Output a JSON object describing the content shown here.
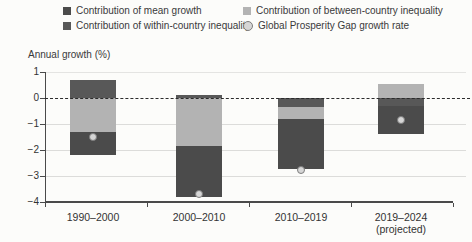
{
  "axis_title": "Annual growth (%)",
  "legend": {
    "items": [
      {
        "label": "Contribution of mean growth",
        "swatch": "square",
        "color": "#4b4b4b"
      },
      {
        "label": "Contribution of between-country inequality",
        "swatch": "square",
        "color": "#b3b3b3"
      },
      {
        "label": "Contribution of within-country inequality",
        "swatch": "square",
        "color": "#585858"
      },
      {
        "label": "Global Prosperity Gap growth rate",
        "swatch": "circle",
        "color": "#d6d6d6",
        "border_color": "#7d7d7d"
      }
    ]
  },
  "chart_data": {
    "type": "bar",
    "subtype": "stacked-bar-with-point-markers",
    "title": "",
    "xlabel": "",
    "ylabel": "Annual growth (%)",
    "ylim": [
      -4,
      1
    ],
    "yticks": [
      1,
      0,
      -1,
      -2,
      -3,
      -4
    ],
    "grid": "horizontal, light gray at integer values; dashed black line at 0",
    "legend_position": "top",
    "categories": [
      {
        "label": "1990–2000",
        "sublabel": ""
      },
      {
        "label": "2000–2010",
        "sublabel": ""
      },
      {
        "label": "2010–2019",
        "sublabel": ""
      },
      {
        "label": "2019–2024",
        "sublabel": "(projected)"
      }
    ],
    "series": [
      {
        "name": "Contribution of within-country inequality",
        "color": "#585858",
        "values": [
          0.7,
          0.1,
          -0.35,
          -0.3
        ]
      },
      {
        "name": "Contribution of between-country inequality",
        "color": "#b3b3b3",
        "values": [
          -1.3,
          -1.85,
          -0.45,
          0.55
        ]
      },
      {
        "name": "Contribution of mean growth",
        "color": "#4b4b4b",
        "values": [
          -0.9,
          -1.95,
          -1.95,
          -1.1
        ]
      }
    ],
    "markers": {
      "name": "Global Prosperity Gap growth rate",
      "values": [
        -1.5,
        -3.7,
        -2.75,
        -0.85
      ]
    },
    "stack_order_note": "segments stack outward from zero in order: within-country, between-country, mean growth"
  },
  "layout": {
    "plot": {
      "x0": 45,
      "x1": 466,
      "y_zero": 98,
      "px_per_unit": 26,
      "bar_width": 46,
      "bar_centers": [
        93,
        199,
        301,
        401
      ],
      "xaxis_end": 453,
      "xticks": [
        45,
        147,
        249,
        351,
        453
      ]
    }
  }
}
